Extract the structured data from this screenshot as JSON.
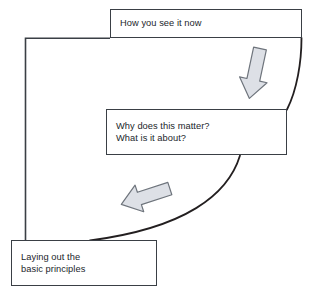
{
  "diagram": {
    "type": "flow-cycle-diagram",
    "background_color": "#ffffff",
    "line_color": "#3a3f45",
    "arrow_fill_color": "#dde0e6",
    "arrow_stroke_color": "#6e747c",
    "text_color": "#22262b",
    "nodes": [
      {
        "id": "top",
        "name": "how-you-see-it-now",
        "lines": [
          "How you see it now"
        ],
        "text": "How you see it now"
      },
      {
        "id": "middle",
        "name": "why-does-this-matter",
        "lines": [
          "Why does this matter?",
          "What is it about?"
        ],
        "text": "Why does this matter?\nWhat is it about?"
      },
      {
        "id": "bottom",
        "name": "laying-out-basic-principles",
        "lines": [
          "Laying out the",
          "basic principles"
        ],
        "text": "Laying out the\nbasic principles"
      }
    ],
    "connectors": [
      {
        "id": "curve-top-to-middle",
        "name": "curve-top-to-middle",
        "from": "top",
        "to": "middle",
        "style": "curved-line"
      },
      {
        "id": "curve-middle-to-bottom",
        "name": "curve-middle-to-bottom",
        "from": "middle",
        "to": "bottom",
        "style": "curved-line"
      },
      {
        "id": "line-bottom-to-top",
        "name": "line-bottom-to-top",
        "from": "bottom",
        "to": "top",
        "style": "elbow-line"
      }
    ],
    "arrows": [
      {
        "id": "arrow-down",
        "name": "arrow-down-right",
        "direction": "down",
        "between": [
          "top",
          "middle"
        ]
      },
      {
        "id": "arrow-left",
        "name": "arrow-down-left",
        "direction": "left",
        "between": [
          "middle",
          "bottom"
        ]
      }
    ]
  }
}
